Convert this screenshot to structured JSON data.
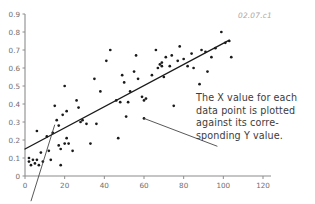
{
  "figure": {
    "corner_label": "02.07.c1",
    "background_color": "#ffffff",
    "point_color": "#1a1a1a",
    "line_color": "#1a1a1a",
    "axis_color": "#8c8c8c",
    "text_color": "#3c3c3c"
  },
  "annotation": {
    "line1": "The X value for each",
    "line2": "data point is plotted",
    "line3": "against its corre-",
    "line4": "sponding Y value.",
    "target_point": {
      "x": 60,
      "y": 0.32
    }
  },
  "chart_data": {
    "type": "scatter",
    "title": "",
    "subtitle": "",
    "xlabel": "",
    "ylabel": "",
    "xlim": [
      0,
      120
    ],
    "ylim": [
      0,
      0.9
    ],
    "xticks": [
      0,
      20,
      40,
      60,
      80,
      100,
      120
    ],
    "yticks": [
      0,
      0.1,
      0.2,
      0.3,
      0.4,
      0.5,
      0.6,
      0.7,
      0.8,
      0.9
    ],
    "xtick_labels": [
      "0",
      "20",
      "40",
      "60",
      "80",
      "100",
      "120"
    ],
    "ytick_labels": [
      "0",
      "0.1",
      "0.2",
      "0.3",
      "0.4",
      "0.5",
      "0.6",
      "0.7",
      "0.8",
      "0.9"
    ],
    "grid": false,
    "legend": null,
    "series": [
      {
        "name": "data points",
        "marker": "dot",
        "points": [
          [
            2,
            0.1
          ],
          [
            2,
            0.08
          ],
          [
            3,
            0.06
          ],
          [
            4,
            0.09
          ],
          [
            5,
            0.07
          ],
          [
            6,
            0.25
          ],
          [
            6,
            0.09
          ],
          [
            7,
            0.06
          ],
          [
            8,
            0.13
          ],
          [
            9,
            0.08
          ],
          [
            11,
            0.22
          ],
          [
            12,
            0.14
          ],
          [
            13,
            0.09
          ],
          [
            14,
            0.24
          ],
          [
            15,
            0.39
          ],
          [
            16,
            0.31
          ],
          [
            17,
            0.17
          ],
          [
            17,
            0.28
          ],
          [
            18,
            0.15
          ],
          [
            18,
            0.06
          ],
          [
            19,
            0.34
          ],
          [
            20,
            0.5
          ],
          [
            20,
            0.18
          ],
          [
            21,
            0.21
          ],
          [
            21,
            0.36
          ],
          [
            22,
            0.18
          ],
          [
            24,
            0.14
          ],
          [
            26,
            0.42
          ],
          [
            27,
            0.38
          ],
          [
            28,
            0.3
          ],
          [
            29,
            0.31
          ],
          [
            31,
            0.29
          ],
          [
            33,
            0.18
          ],
          [
            35,
            0.54
          ],
          [
            36,
            0.29
          ],
          [
            38,
            0.47
          ],
          [
            41,
            0.64
          ],
          [
            43,
            0.7
          ],
          [
            46,
            0.42
          ],
          [
            47,
            0.21
          ],
          [
            48,
            0.41
          ],
          [
            49,
            0.56
          ],
          [
            50,
            0.52
          ],
          [
            51,
            0.33
          ],
          [
            52,
            0.41
          ],
          [
            53,
            0.47
          ],
          [
            55,
            0.58
          ],
          [
            56,
            0.67
          ],
          [
            57,
            0.54
          ],
          [
            59,
            0.44
          ],
          [
            60,
            0.32
          ],
          [
            60,
            0.42
          ],
          [
            61,
            0.43
          ],
          [
            64,
            0.56
          ],
          [
            66,
            0.7
          ],
          [
            67,
            0.6
          ],
          [
            68,
            0.62
          ],
          [
            69,
            0.61
          ],
          [
            69,
            0.63
          ],
          [
            70,
            0.55
          ],
          [
            71,
            0.66
          ],
          [
            73,
            0.61
          ],
          [
            74,
            0.67
          ],
          [
            75,
            0.39
          ],
          [
            77,
            0.64
          ],
          [
            78,
            0.72
          ],
          [
            80,
            0.65
          ],
          [
            82,
            0.61
          ],
          [
            84,
            0.68
          ],
          [
            85,
            0.6
          ],
          [
            88,
            0.51
          ],
          [
            89,
            0.7
          ],
          [
            91,
            0.69
          ],
          [
            92,
            0.58
          ],
          [
            94,
            0.66
          ],
          [
            96,
            0.71
          ],
          [
            99,
            0.8
          ],
          [
            101,
            0.74
          ],
          [
            103,
            0.75
          ],
          [
            104,
            0.66
          ]
        ]
      }
    ],
    "trend_line": {
      "name": "regression line",
      "start": [
        0,
        0.15
      ],
      "end": [
        103,
        0.755
      ]
    },
    "leader_lines": [
      {
        "name": "annotation-leader",
        "from": [
          60,
          0.32
        ],
        "to": [
          97,
          0.165
        ]
      },
      {
        "name": "lower-left-leader",
        "from": [
          15,
          0.285
        ],
        "to": [
          3,
          -0.14
        ]
      }
    ]
  }
}
